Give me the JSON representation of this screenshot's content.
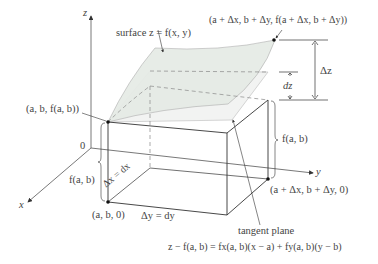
{
  "figure": {
    "axes": {
      "z_label": "z",
      "y_label": "y",
      "x_label": "x",
      "origin_label": "0"
    },
    "labels": {
      "surface": "surface z = f(x, y)",
      "top_point": "(a + Δx, b + Δy, f(a + Δx, b + Δy))",
      "base_point_top": "(a, b, f(a, b))",
      "base_point_bottom": "(a, b, 0)",
      "far_point_bottom": "(a + Δx, b + Δy, 0)",
      "delta_z": "Δz",
      "dz": "dz",
      "height_right": "f(a, b)",
      "height_left": "f(a, b)",
      "delta_x": "Δx = dx",
      "delta_y": "Δy = dy",
      "tangent_plane": "tangent plane",
      "tangent_equation": "z − f(a, b) = fx(a, b)(x − a) + fy(a, b)(y − b)"
    },
    "colors": {
      "line": "#333333",
      "surface_fill": "#e8ece8",
      "plane_fill": "#f3f4f3",
      "dashed": "#777777"
    }
  }
}
